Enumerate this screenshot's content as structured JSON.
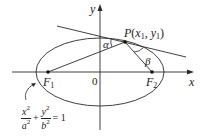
{
  "figure": {
    "type": "ellipse-reflection-diagram",
    "axes": {
      "x_label": "x",
      "y_label": "y",
      "origin_label": "0"
    },
    "ellipse": {
      "center": [
        100,
        72
      ],
      "rx": 64,
      "ry": 34
    },
    "foci": [
      {
        "name": "F",
        "sub": "1",
        "pos": [
          48,
          72
        ]
      },
      {
        "name": "F",
        "sub": "2",
        "pos": [
          152,
          72
        ]
      }
    ],
    "point": {
      "name": "P",
      "label_open": "(",
      "x_name": "x",
      "x_sub": "1",
      "sep": ", ",
      "y_name": "y",
      "y_sub": "1",
      "label_close": ")",
      "pos": [
        125,
        42
      ]
    },
    "angles": {
      "alpha": "α",
      "beta": "β"
    },
    "equation": {
      "term1_num": "x",
      "term1_num_sup": "2",
      "term1_den": "a",
      "term1_den_sup": "2",
      "plus": "+",
      "term2_num": "y",
      "term2_num_sup": "2",
      "term2_den": "b",
      "term2_den_sup": "2",
      "rhs": "= 1"
    },
    "colors": {
      "line": "#2a2a2a",
      "text": "#222222",
      "background": "#ffffff"
    }
  }
}
